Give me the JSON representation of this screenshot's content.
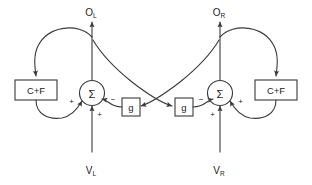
{
  "diagram": {
    "background_color": "#ffffff",
    "line_color": "#3a3a3a",
    "text_color": "#1d1d1d",
    "blocks": {
      "cf_left": {
        "label": "C+F"
      },
      "cf_right": {
        "label": "C+F"
      },
      "g_left": {
        "label": "g"
      },
      "g_right": {
        "label": "g"
      },
      "sum_left": {
        "label": "Σ"
      },
      "sum_right": {
        "label": "Σ"
      }
    },
    "io": {
      "output_left": {
        "base": "O",
        "sub": "L"
      },
      "output_right": {
        "base": "O",
        "sub": "R"
      },
      "input_left": {
        "base": "V",
        "sub": "L"
      },
      "input_right": {
        "base": "V",
        "sub": "R"
      }
    },
    "signs": {
      "sum_left_cf": "+",
      "sum_left_input": "+",
      "sum_left_g": "−",
      "sum_right_cf": "+",
      "sum_right_input": "+",
      "sum_right_g": "−"
    }
  }
}
